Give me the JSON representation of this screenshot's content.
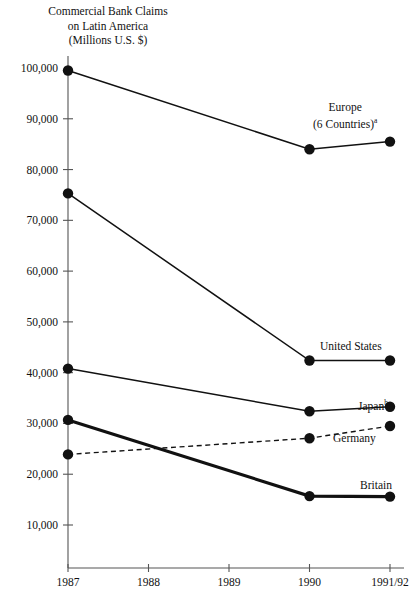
{
  "chart_data": {
    "type": "line",
    "title": "Commercial Bank Claims\non Latin America\n(Millions U.S. $)",
    "title_line1": "Commercial Bank Claims",
    "title_line2": "on Latin America",
    "title_line3": "(Millions U.S. $)",
    "xlabel": "",
    "ylabel": "",
    "ylim": [
      0,
      100000
    ],
    "yticks": [
      10000,
      20000,
      30000,
      40000,
      50000,
      60000,
      70000,
      80000,
      90000,
      100000
    ],
    "ytick_labels": [
      "10,000",
      "20,000",
      "30,000",
      "40,000",
      "50,000",
      "60,000",
      "70,000",
      "80,000",
      "90,000",
      "100,000"
    ],
    "categories": [
      "1987",
      "1988",
      "1989",
      "1990",
      "1991/92"
    ],
    "x": [
      1987,
      1988,
      1989,
      1990,
      1991
    ],
    "grid": false,
    "legend": "inline-right-of-line-ends",
    "series": [
      {
        "name": "Europe (6 Countries)",
        "label_line1": "Europe",
        "label_line2": "(6 Countries)",
        "footnote_marker": "a",
        "style": "solid",
        "x": [
          "1987",
          "1990",
          "1991/92"
        ],
        "values": [
          99500,
          84000,
          85500
        ]
      },
      {
        "name": "United States",
        "label_line1": "United States",
        "label_line2": "",
        "footnote_marker": "",
        "style": "solid",
        "x": [
          "1987",
          "1990",
          "1991/92"
        ],
        "values": [
          75300,
          42400,
          42400
        ]
      },
      {
        "name": "Japan",
        "label_line1": "Japan",
        "label_line2": "",
        "footnote_marker": "b",
        "style": "solid",
        "x": [
          "1987",
          "1990",
          "1991/92"
        ],
        "values": [
          40800,
          32400,
          33300
        ]
      },
      {
        "name": "Germany",
        "label_line1": "Germany",
        "label_line2": "",
        "footnote_marker": "",
        "style": "dashed",
        "x": [
          "1987",
          "1990",
          "1991/92"
        ],
        "values": [
          23900,
          27100,
          29500
        ]
      },
      {
        "name": "Britain",
        "label_line1": "Britain",
        "label_line2": "",
        "footnote_marker": "",
        "style": "thick",
        "x": [
          "1987",
          "1990",
          "1991/92"
        ],
        "values": [
          30700,
          15700,
          15600
        ]
      }
    ]
  }
}
